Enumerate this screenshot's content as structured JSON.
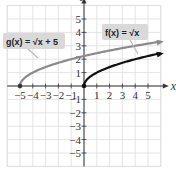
{
  "chart_data": {
    "type": "line",
    "title": "",
    "xlabel": "x",
    "ylabel": "y",
    "xlim": [
      -6,
      6
    ],
    "ylim": [
      -6,
      6
    ],
    "grid": true,
    "x_ticks": [
      "-5",
      "-4",
      "-3",
      "-2",
      "-1",
      "1",
      "2",
      "3",
      "4",
      "5"
    ],
    "y_ticks": [
      "5",
      "4",
      "3",
      "2",
      "1",
      "-1",
      "-2",
      "-3",
      "-4",
      "-5"
    ],
    "x_tick_values": [
      -5,
      -4,
      -3,
      -2,
      -1,
      1,
      2,
      3,
      4,
      5
    ],
    "y_tick_values": [
      5,
      4,
      3,
      2,
      1,
      -1,
      -2,
      -3,
      -4,
      -5
    ],
    "series": [
      {
        "name": "g(x) = √(x + 5)",
        "function": "sqrt(x+5)",
        "domain": [
          -5,
          6
        ],
        "color": "#8a8a8a",
        "start_point": [
          -5,
          0
        ]
      },
      {
        "name": "f(x) = √x",
        "function": "sqrt(x)",
        "domain": [
          0,
          6
        ],
        "color": "#111111",
        "start_point": [
          0,
          0
        ]
      }
    ],
    "annotations": [
      {
        "text": "g(x) = √x + 5",
        "series": 0
      },
      {
        "text": "f(x) = √x",
        "series": 1
      }
    ]
  }
}
